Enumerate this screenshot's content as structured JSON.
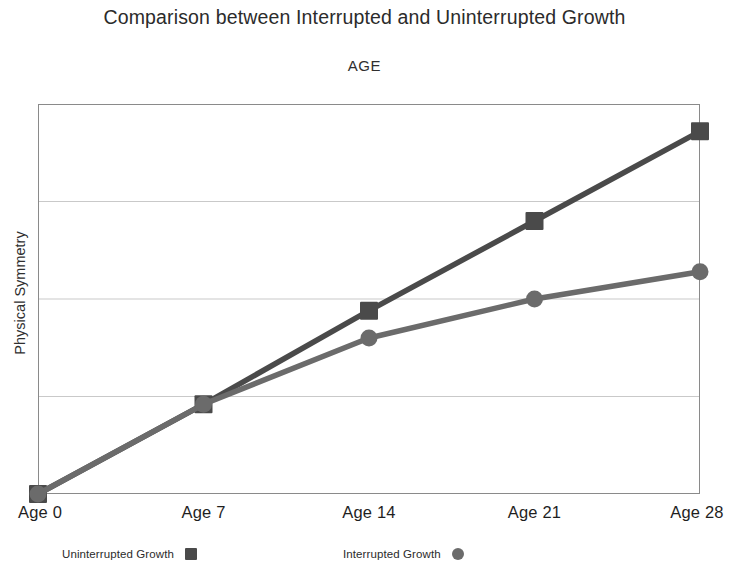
{
  "chart_data": {
    "type": "line",
    "title": "Comparison between Interrupted and Uninterrupted Growth",
    "subtitle": "AGE",
    "xlabel": "AGE",
    "ylabel": "Physical Symmetry",
    "categories": [
      "Age 0",
      "Age 7",
      "Age 14",
      "Age 21",
      "Age 28"
    ],
    "x": [
      0,
      7,
      14,
      21,
      28
    ],
    "ylim": [
      0,
      100
    ],
    "xlim": [
      0,
      28
    ],
    "grid": true,
    "grid_axis": "y",
    "gridline_values": [
      25,
      50,
      75
    ],
    "y_tick_labels": [],
    "legend_position": "bottom",
    "series": [
      {
        "name": "Uninterrupted Growth",
        "marker": "square",
        "color": "#4a4a4a",
        "values": [
          0,
          23,
          47,
          70,
          93
        ]
      },
      {
        "name": "Interrupted Growth",
        "marker": "circle",
        "color": "#6b6b6b",
        "values": [
          0,
          23,
          40,
          50,
          57
        ]
      }
    ]
  },
  "legend": {
    "entries": [
      {
        "label": "Uninterrupted Growth",
        "marker": "square",
        "color": "#4a4a4a"
      },
      {
        "label": "Interrupted Growth",
        "marker": "circle",
        "color": "#6b6b6b"
      }
    ]
  },
  "colors": {
    "uninterrupted": "#4a4a4a",
    "interrupted": "#6b6b6b",
    "plot_border": "#8a8a8a",
    "gridline": "#c9c9c9",
    "text": "#262626",
    "background": "#ffffff"
  }
}
